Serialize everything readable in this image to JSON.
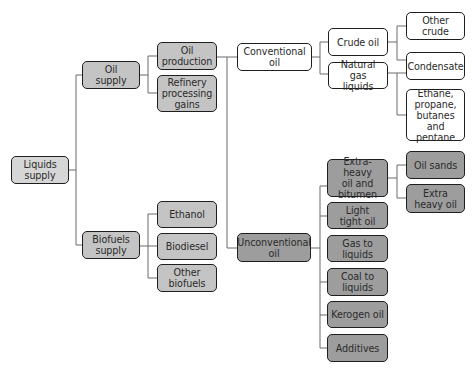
{
  "diagram": {
    "type": "tree",
    "colors": {
      "root": "#d6d6d6",
      "oil_and_biofuels": "#c4c4c4",
      "conventional": "#ffffff",
      "unconventional": "#9d9d9d",
      "border": "#1e1e1e",
      "connector": "#6a6a6a"
    },
    "nodes": {
      "liquids_supply": "Liquids\nsupply",
      "oil_supply": "Oil\nsupply",
      "biofuels_supply": "Biofuels\nsupply",
      "oil_production": "Oil\nproduction",
      "refinery_processing_gains": "Refinery\nprocessing\ngains",
      "ethanol": "Ethanol",
      "biodiesel": "Biodiesel",
      "other_biofuels": "Other\nbiofuels",
      "conventional_oil": "Conventional\noil",
      "unconventional_oil": "Unconventional\noil",
      "crude_oil": "Crude oil",
      "natural_gas_liquids": "Natural gas\nliquids",
      "other_crude": "Other crude",
      "condensate": "Condensate",
      "ethane_propane": "Ethane,\npropane,\nbutanes and\npentane",
      "extra_heavy_bitumen": "Extra-heavy\noil and\nbitumen",
      "light_tight_oil": "Light\ntight oil",
      "gas_to_liquids": "Gas to\nliquids",
      "coal_to_liquids": "Coal to\nliquids",
      "kerogen_oil": "Kerogen oil",
      "additives": "Additives",
      "oil_sands": "Oil sands",
      "extra_heavy_oil": "Extra\nheavy oil"
    },
    "edges": [
      [
        "liquids_supply",
        "oil_supply"
      ],
      [
        "liquids_supply",
        "biofuels_supply"
      ],
      [
        "oil_supply",
        "oil_production"
      ],
      [
        "oil_supply",
        "refinery_processing_gains"
      ],
      [
        "biofuels_supply",
        "ethanol"
      ],
      [
        "biofuels_supply",
        "biodiesel"
      ],
      [
        "biofuels_supply",
        "other_biofuels"
      ],
      [
        "oil_production",
        "conventional_oil"
      ],
      [
        "oil_production",
        "unconventional_oil"
      ],
      [
        "conventional_oil",
        "crude_oil"
      ],
      [
        "conventional_oil",
        "natural_gas_liquids"
      ],
      [
        "crude_oil",
        "other_crude"
      ],
      [
        "crude_oil",
        "condensate"
      ],
      [
        "natural_gas_liquids",
        "condensate"
      ],
      [
        "natural_gas_liquids",
        "ethane_propane"
      ],
      [
        "unconventional_oil",
        "extra_heavy_bitumen"
      ],
      [
        "unconventional_oil",
        "light_tight_oil"
      ],
      [
        "unconventional_oil",
        "gas_to_liquids"
      ],
      [
        "unconventional_oil",
        "coal_to_liquids"
      ],
      [
        "unconventional_oil",
        "kerogen_oil"
      ],
      [
        "unconventional_oil",
        "additives"
      ],
      [
        "extra_heavy_bitumen",
        "oil_sands"
      ],
      [
        "extra_heavy_bitumen",
        "extra_heavy_oil"
      ]
    ]
  }
}
